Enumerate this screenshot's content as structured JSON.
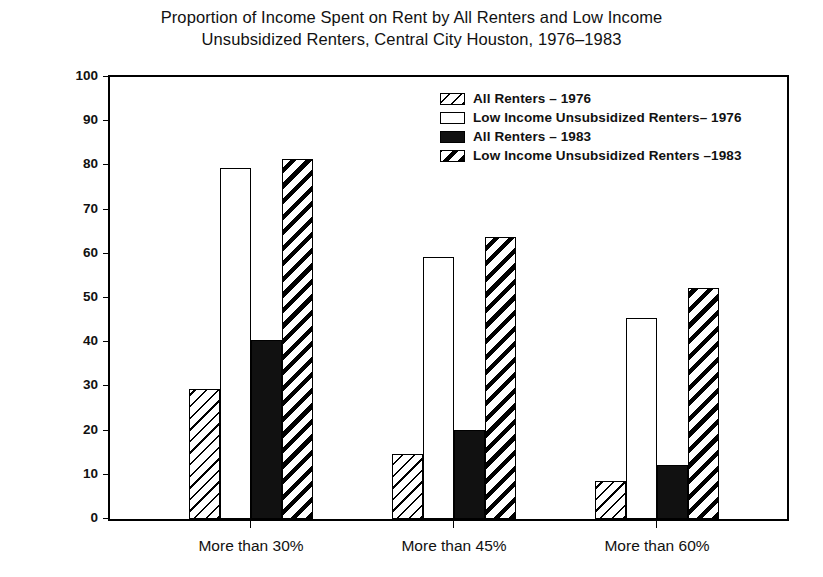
{
  "chart_data": {
    "type": "bar",
    "title": "Proportion of Income Spent on Rent by All Renters and Low Income Unsubsidized Renters, Central City Houston, 1976–1983",
    "title_line1": "Proportion of Income Spent on Rent by All Renters and Low Income",
    "title_line2": "Unsubsidized Renters, Central City Houston, 1976–1983",
    "xlabel": "",
    "ylabel": "Percent of Renters",
    "ylim": [
      0,
      100
    ],
    "yticks": [
      0,
      10,
      20,
      30,
      40,
      50,
      60,
      70,
      80,
      90,
      100
    ],
    "ytick_labels": [
      "0",
      "10",
      "20",
      "30",
      "40",
      "50",
      "60",
      "70",
      "80",
      "90",
      "100"
    ],
    "grid": false,
    "legend_position": "upper right inside",
    "categories": [
      "More than 30%",
      "More than 45%",
      "More than 60%"
    ],
    "series": [
      {
        "name": "All Renters – 1976",
        "fill": "hatch-thin-backslash",
        "values": [
          29.5,
          14.8,
          8.6
        ]
      },
      {
        "name": "Low Income Unsubsidized Renters– 1976",
        "fill": "empty-white",
        "values": [
          79.5,
          59.3,
          45.5
        ]
      },
      {
        "name": "All Renters – 1983",
        "fill": "solid-black",
        "values": [
          40.5,
          20.2,
          12.2
        ]
      },
      {
        "name": "Low Income Unsubsidized Renters –1983",
        "fill": "hatch-thick-backslash",
        "values": [
          81.5,
          63.8,
          52.2
        ]
      }
    ]
  },
  "colors": {
    "axis": "#000000",
    "bar_outline": "#000000",
    "solid_fill": "#111111",
    "background": "#ffffff"
  }
}
